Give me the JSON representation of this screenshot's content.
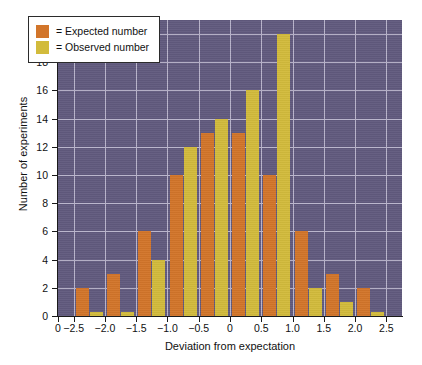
{
  "chart_data": {
    "type": "bar",
    "title": "",
    "subtitle": "",
    "xlabel": "Deviation from expectation",
    "ylabel": "Number of experiments",
    "grid": true,
    "legend_position": "top-left",
    "xlim": [
      -2.75,
      2.75
    ],
    "ylim": [
      0,
      21
    ],
    "ytick_labels": [
      "0",
      "2",
      "4",
      "6",
      "8",
      "10",
      "12",
      "14",
      "16",
      "18",
      "20"
    ],
    "ytick_values": [
      0,
      2,
      4,
      6,
      8,
      10,
      12,
      14,
      16,
      18,
      20
    ],
    "xtick_labels": [
      "0",
      "−2.5",
      "−2.0",
      "−1.5",
      "−1.0",
      "−0.5",
      "0",
      "0.5",
      "1.0",
      "1.5",
      "2.0",
      "2.5"
    ],
    "xtick_values": [
      -2.75,
      -2.5,
      -2.0,
      -1.5,
      -1.0,
      -0.5,
      0,
      0.5,
      1.0,
      1.5,
      2.0,
      2.5
    ],
    "categories": [
      -2.25,
      -1.75,
      -1.25,
      -0.75,
      -0.25,
      0.25,
      0.75,
      1.25,
      1.75,
      2.25
    ],
    "series": [
      {
        "name": "Expected number",
        "color": "#d2752a",
        "values": [
          2,
          3,
          6,
          10,
          13,
          13,
          10,
          6,
          3,
          2
        ]
      },
      {
        "name": "Observed number",
        "color": "#d2bb3c",
        "values": [
          0.3,
          0.3,
          4,
          12,
          14,
          16,
          20,
          2,
          1,
          0.3
        ]
      }
    ],
    "plot_background": "#615a7e",
    "gridline_color": "#b9b4cb"
  },
  "legend": {
    "entries": [
      {
        "marker": "expected-swatch",
        "label": "= Expected number"
      },
      {
        "marker": "observed-swatch",
        "label": "= Observed number"
      }
    ]
  }
}
